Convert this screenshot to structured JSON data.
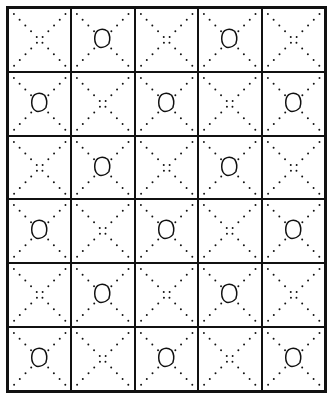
{
  "diagram": {
    "rows": 6,
    "cols": 5,
    "line_color": "#111111",
    "cells": [
      [
        0,
        1,
        0,
        1,
        0
      ],
      [
        1,
        0,
        1,
        0,
        1
      ],
      [
        0,
        1,
        0,
        1,
        0
      ],
      [
        1,
        0,
        1,
        0,
        1
      ],
      [
        0,
        1,
        0,
        1,
        0
      ],
      [
        1,
        0,
        1,
        0,
        1
      ]
    ],
    "legend": {
      "1": "dotted X with circle",
      "0": "dotted X only"
    }
  }
}
